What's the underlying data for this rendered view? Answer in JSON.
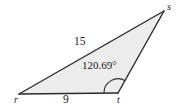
{
  "figure": {
    "type": "triangle-diagram",
    "colors": {
      "fill": "#ececec",
      "stroke": "#2b2b2b",
      "background": "#ffffff",
      "text": "#1a1a1a"
    },
    "vertices": [
      {
        "name": "r",
        "label": "r",
        "x": 19,
        "y": 94
      },
      {
        "name": "t",
        "label": "t",
        "x": 118,
        "y": 93
      },
      {
        "name": "s",
        "label": "s",
        "x": 164,
        "y": 11
      }
    ],
    "sides": [
      {
        "name": "rs",
        "label": "15",
        "from": "r",
        "to": "s"
      },
      {
        "name": "rt",
        "label": "9",
        "from": "r",
        "to": "t"
      },
      {
        "name": "ts",
        "label": "",
        "from": "t",
        "to": "s"
      }
    ],
    "angles": [
      {
        "name": "angle-t",
        "at": "t",
        "label": "120.69°",
        "value": 120.69,
        "unit": "degrees"
      }
    ]
  }
}
